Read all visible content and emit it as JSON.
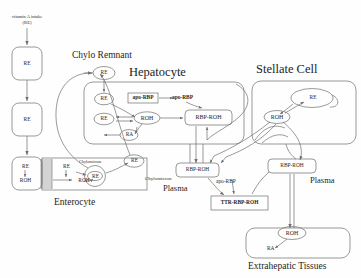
{
  "figure": {
    "title_intake": "vitamin A intake",
    "title_intake_unit": "(RE)",
    "compartments": [
      {
        "id": "chylo-remnant",
        "label": "Chylo Remnant"
      },
      {
        "id": "hepatocyte",
        "label": "Hepatocyte"
      },
      {
        "id": "stellate-cell",
        "label": "Stellate Cell"
      },
      {
        "id": "enterocyte",
        "label": "Enterocyte"
      },
      {
        "id": "extrahepatic-tissues",
        "label": "Extrahepatic Tissues"
      }
    ],
    "plasma_labels": [
      "Plasma",
      "Plasma"
    ],
    "gut_chain": [
      {
        "id": "gut-re-1",
        "label": "RE"
      },
      {
        "id": "gut-re-2",
        "label": "RE"
      }
    ],
    "lumen_node": {
      "re": "RE",
      "roh": "ROH"
    },
    "enterocyte_nodes": {
      "re": "RE",
      "roh": "ROH",
      "chylomicron_inner_re": "RE",
      "chylomicron_inner_label": "Chylomicron",
      "chylomicron_outer_label": "Chylomicron",
      "chylomicron_outer_re": "RE"
    },
    "hepatocyte_nodes": {
      "re_top": "RE",
      "re_left": "RE",
      "roh": "ROH",
      "ra": "RA",
      "apo_rbp_box": "apo-RBP",
      "apo_rbp_out": "apo-RBP",
      "rbp_roh": "RBP-ROH"
    },
    "stellate_nodes": {
      "re": "RE",
      "roh": "ROH"
    },
    "plasma_nodes": {
      "rbp_roh_left": "RBP-ROH",
      "apo_rbp": "apo-RBP",
      "ttr_rbp_roh": "TTR-RBP-ROH",
      "rbp_roh_right": "RBP-ROH"
    },
    "extrahepatic_nodes": {
      "roh": "ROH",
      "ra": "RA"
    },
    "colors": {
      "stroke": "#6f6f6f",
      "text": "#262626",
      "background": "#fefefe"
    }
  }
}
